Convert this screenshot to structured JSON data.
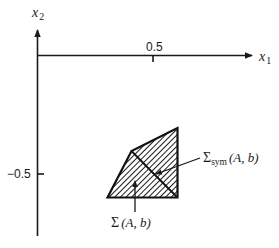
{
  "figure": {
    "axes": {
      "x_label": "x",
      "x_label_sub": "1",
      "y_label": "x",
      "y_label_sub": "2",
      "x_ticks": [
        {
          "value": 0.5,
          "label": "0.5"
        }
      ],
      "y_ticks": [
        {
          "value": -0.5,
          "label": "−0.5"
        }
      ]
    },
    "regions": [
      {
        "name": "Sigma(A,b)",
        "label_main": "Σ",
        "label_args": "(A, b)",
        "vertices_approx": [
          [
            0.35,
            -0.62
          ],
          [
            0.45,
            -0.44
          ],
          [
            0.65,
            -0.33
          ],
          [
            0.65,
            -0.62
          ]
        ]
      },
      {
        "name": "Sigma_sym(A,b)",
        "label_main": "Σ",
        "label_sub": "sym",
        "label_args": "(A, b)",
        "description": "upper-right portion of the polygon, separated by an inner diagonal edge"
      }
    ],
    "style": {
      "line_color": "#1a1a1a",
      "fill_pattern": "diagonal-hatch",
      "background": "#ffffff"
    }
  }
}
